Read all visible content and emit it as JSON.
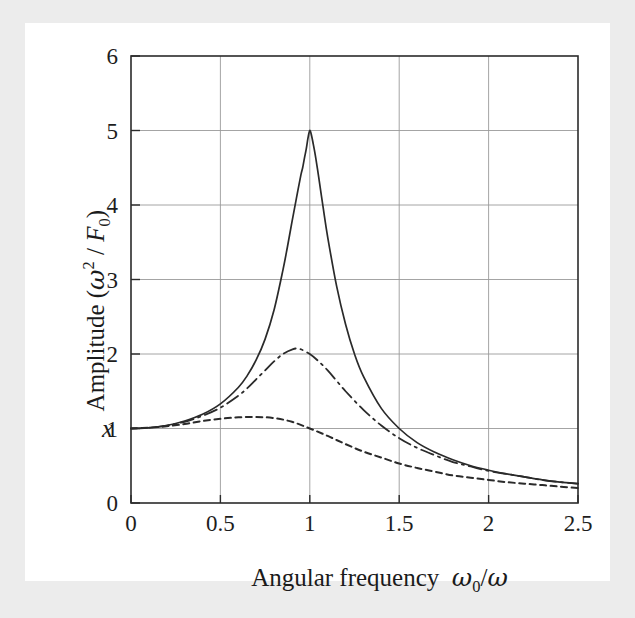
{
  "figure": {
    "background_color": "#ececec",
    "canvas_color": "#ffffff",
    "axis_color": "#2b2b2b",
    "grid_color": "#9a9a9a",
    "curve_color": "#2a2a2a"
  },
  "axes": {
    "x_tick_labels": [
      "0",
      "0.5",
      "1",
      "1.5",
      "2",
      "2.5"
    ],
    "y_tick_labels": [
      "0",
      "1",
      "2",
      "3",
      "4",
      "5",
      "6"
    ],
    "x_label_text": "Angular frequency",
    "x_label_symbol_omega": "ω",
    "x_label_symbol_sub": "0",
    "x_label_symbol_divider": "/",
    "y_label_prefix": "Amplitude (",
    "y_label_omega": "ω",
    "y_label_exponent": "2",
    "y_label_divider": " / ",
    "y_label_force": "F",
    "y_label_force_sub": "0",
    "y_label_suffix": ")",
    "y_label_variable": "x"
  },
  "chart_data": {
    "type": "line",
    "title": "",
    "xlabel": "Angular frequency ω₀/ω",
    "ylabel": "Amplitude (ω² / F₀)  x",
    "xlim": [
      0,
      2.5
    ],
    "ylim": [
      0,
      6
    ],
    "xticks": [
      0,
      0.5,
      1,
      1.5,
      2,
      2.5
    ],
    "yticks": [
      0,
      1,
      2,
      3,
      4,
      5,
      6
    ],
    "grid": true,
    "legend": "none",
    "series": [
      {
        "name": "low damping (Q = 5)",
        "style": "solid",
        "quality_factor": 5,
        "peak_x": 1.0,
        "peak_y": 5.0,
        "x": [
          0,
          0.1,
          0.2,
          0.3,
          0.4,
          0.5,
          0.6,
          0.65,
          0.7,
          0.75,
          0.8,
          0.85,
          0.875,
          0.9,
          0.925,
          0.95,
          0.96,
          0.97,
          0.98,
          0.99,
          1.0,
          1.01,
          1.02,
          1.03,
          1.04,
          1.05,
          1.075,
          1.1,
          1.15,
          1.2,
          1.25,
          1.3,
          1.4,
          1.5,
          1.6,
          1.7,
          1.8,
          1.9,
          2.0,
          2.1,
          2.2,
          2.3,
          2.4,
          2.5
        ],
        "y": [
          1.0,
          1.01,
          1.04,
          1.1,
          1.19,
          1.33,
          1.55,
          1.71,
          1.92,
          2.2,
          2.59,
          3.13,
          3.44,
          3.77,
          4.09,
          4.4,
          4.5,
          4.63,
          4.75,
          4.9,
          5.0,
          4.93,
          4.81,
          4.68,
          4.53,
          4.37,
          3.96,
          3.57,
          2.91,
          2.4,
          2.0,
          1.7,
          1.27,
          1.0,
          0.81,
          0.68,
          0.58,
          0.5,
          0.44,
          0.39,
          0.35,
          0.31,
          0.28,
          0.26
        ]
      },
      {
        "name": "medium damping (Q = 2)",
        "style": "dash-dot",
        "quality_factor": 2,
        "peak_x": 0.94,
        "peak_y": 2.07,
        "x": [
          0,
          0.1,
          0.2,
          0.3,
          0.4,
          0.5,
          0.6,
          0.65,
          0.7,
          0.75,
          0.8,
          0.85,
          0.9,
          0.94,
          1.0,
          1.05,
          1.1,
          1.15,
          1.2,
          1.3,
          1.4,
          1.5,
          1.6,
          1.7,
          1.8,
          1.9,
          2.0,
          2.1,
          2.2,
          2.3,
          2.4,
          2.5
        ],
        "y": [
          1.0,
          1.01,
          1.04,
          1.09,
          1.17,
          1.28,
          1.44,
          1.54,
          1.66,
          1.78,
          1.9,
          2.0,
          2.06,
          2.07,
          2.0,
          1.9,
          1.78,
          1.64,
          1.5,
          1.25,
          1.04,
          0.87,
          0.74,
          0.64,
          0.55,
          0.49,
          0.43,
          0.39,
          0.35,
          0.31,
          0.28,
          0.26
        ]
      },
      {
        "name": "heavy damping (Q = 1)",
        "style": "dotted",
        "quality_factor": 1,
        "peak_x": 0.7,
        "peak_y": 1.155,
        "x": [
          0,
          0.1,
          0.2,
          0.3,
          0.4,
          0.5,
          0.6,
          0.7,
          0.8,
          0.9,
          1.0,
          1.1,
          1.2,
          1.3,
          1.4,
          1.5,
          1.6,
          1.7,
          1.8,
          1.9,
          2.0,
          2.1,
          2.2,
          2.3,
          2.4,
          2.5
        ],
        "y": [
          1.0,
          1.01,
          1.03,
          1.06,
          1.1,
          1.13,
          1.15,
          1.155,
          1.14,
          1.09,
          1.0,
          0.9,
          0.79,
          0.69,
          0.61,
          0.53,
          0.47,
          0.42,
          0.37,
          0.34,
          0.31,
          0.28,
          0.26,
          0.24,
          0.22,
          0.2
        ]
      }
    ]
  }
}
